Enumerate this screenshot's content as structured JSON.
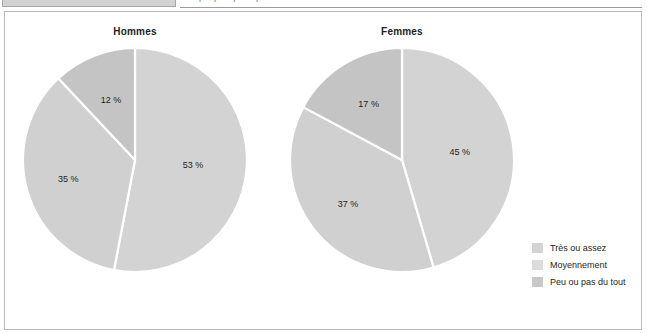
{
  "top_strip": {
    "header_cell_label": "",
    "clipped_caption": "Graphique : perception de la santé selon le sexe"
  },
  "legend": {
    "items": [
      {
        "label": "Très ou assez",
        "color": "#d3d3d3"
      },
      {
        "label": "Moyennement",
        "color": "#dcdcdc"
      },
      {
        "label": "Peu ou pas du tout",
        "color": "#c8c8c8"
      }
    ]
  },
  "chart_data": [
    {
      "type": "pie",
      "title": "Hommes",
      "categories": [
        "Très ou assez",
        "Moyennement",
        "Peu ou pas du tout"
      ],
      "values": [
        53,
        35,
        12
      ],
      "labels": [
        "53 %",
        "35 %",
        "12 %"
      ],
      "colors": [
        "#d3d3d3",
        "#d0d0d0",
        "#c4c4c4"
      ],
      "unit": "%",
      "start_angle": 0,
      "direction": "clockwise",
      "legend_position": "right"
    },
    {
      "type": "pie",
      "title": "Femmes",
      "categories": [
        "Très ou assez",
        "Moyennement",
        "Peu ou pas du tout"
      ],
      "values": [
        45,
        37,
        17
      ],
      "labels": [
        "45 %",
        "37 %",
        "17 %"
      ],
      "colors": [
        "#d3d3d3",
        "#d0d0d0",
        "#c4c4c4"
      ],
      "unit": "%",
      "start_angle": 0,
      "direction": "clockwise",
      "legend_position": "right"
    }
  ]
}
